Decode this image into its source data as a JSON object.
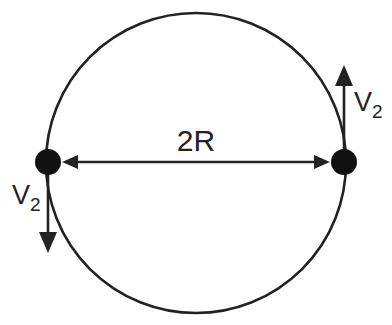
{
  "diagram": {
    "type": "circular-orbit-two-bodies",
    "colors": {
      "stroke": "#222222",
      "body": "#111111",
      "background": "#ffffff"
    },
    "circle": {
      "cx": 196,
      "cy": 163,
      "r": 150
    },
    "bodies": [
      {
        "name": "left-body",
        "cx": 48,
        "cy": 162,
        "r": 13
      },
      {
        "name": "right-body",
        "cx": 344,
        "cy": 162,
        "r": 13
      }
    ],
    "distance_label": "2R",
    "velocity_labels": {
      "left": {
        "main": "V",
        "sub": "2"
      },
      "right": {
        "main": "V",
        "sub": "2"
      }
    }
  }
}
